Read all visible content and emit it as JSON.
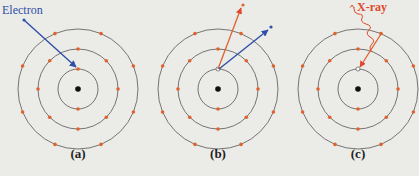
{
  "figure": {
    "panels": [
      {
        "id": "a",
        "caption": "(a)",
        "cx": 78,
        "label": "Electron",
        "event": "incoming electron strikes inner-shell electron"
      },
      {
        "id": "b",
        "caption": "(b)",
        "cx": 218,
        "event": "inner-shell electron ejected; incident electron scattered"
      },
      {
        "id": "c",
        "caption": "(c)",
        "cx": 358,
        "label": "X-ray",
        "event": "outer electron fills vacancy emitting X-ray"
      }
    ],
    "shells": {
      "radii": [
        20,
        40,
        60
      ],
      "electrons": [
        2,
        8,
        8
      ]
    },
    "colors": {
      "background": "#ebebe8",
      "shell": "#555555",
      "electron": "#e0622c",
      "nucleus": "#111111",
      "incident": "#2f4fa8",
      "xray": "#e0482c"
    }
  },
  "bottom_text": "(cropped caption text)"
}
